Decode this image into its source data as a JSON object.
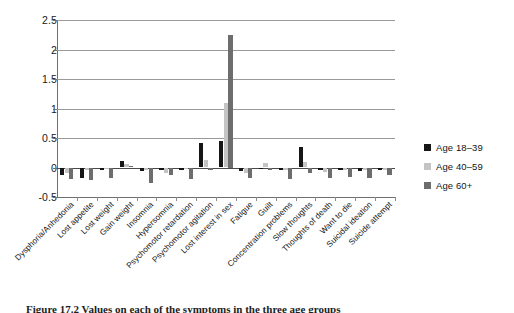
{
  "chart_data": {
    "type": "bar",
    "title": "",
    "xlabel": "",
    "ylabel": "",
    "ylim": [
      -0.5,
      2.5
    ],
    "ytick_labels": [
      "2.5",
      "2",
      "1.5",
      "1",
      "0.5",
      "0",
      "-0.5"
    ],
    "ytick_values": [
      2.5,
      2,
      1.5,
      1,
      0.5,
      0,
      -0.5
    ],
    "grid": true,
    "legend_position": "right",
    "categories": [
      "Dysphoria/Anhedonia",
      "Lost appetite",
      "Lost weight",
      "Gain weight",
      "Insomnia",
      "Hypersomnia",
      "Psychomotor retardation",
      "Psychomotor agitation",
      "Lost interest in sex",
      "Fatigue",
      "Guilt",
      "Concentration problems",
      "Slow thoughts",
      "Thoughts of death",
      "Want to die",
      "Suicidal ideation",
      "Suicide attempt"
    ],
    "series": [
      {
        "name": "Age 18–39",
        "color": "#161616",
        "values": [
          -0.12,
          -0.17,
          -0.05,
          0.11,
          -0.06,
          -0.04,
          -0.05,
          0.42,
          0.45,
          -0.06,
          -0.03,
          -0.05,
          0.35,
          -0.05,
          -0.05,
          -0.06,
          -0.05
        ]
      },
      {
        "name": "Age 40–59",
        "color": "#c4c4c4",
        "values": [
          -0.09,
          -0.05,
          -0.03,
          0.06,
          -0.04,
          -0.1,
          -0.03,
          0.12,
          1.1,
          -0.1,
          0.07,
          -0.04,
          0.1,
          -0.07,
          -0.04,
          -0.05,
          -0.04
        ]
      },
      {
        "name": "Age 60+",
        "color": "#6d6d6d",
        "values": [
          -0.2,
          -0.22,
          -0.18,
          0.02,
          -0.27,
          -0.13,
          -0.19,
          -0.05,
          2.25,
          -0.17,
          -0.04,
          -0.19,
          -0.1,
          -0.17,
          -0.16,
          -0.18,
          -0.13
        ]
      }
    ]
  },
  "legend": {
    "items": [
      {
        "label": "Age 18–39",
        "color": "#161616"
      },
      {
        "label": "Age 40–59",
        "color": "#c4c4c4"
      },
      {
        "label": "Age 60+",
        "color": "#6d6d6d"
      }
    ]
  },
  "caption": "Figure 17.2  Values on each of the symptoms in the three age groups"
}
